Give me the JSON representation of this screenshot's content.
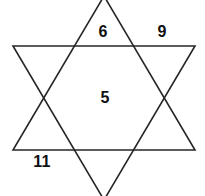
{
  "figure": {
    "name": "hexagram",
    "background_color": "#ffffff",
    "stroke_color": "#262626",
    "label_color": "#101010",
    "labels": [
      {
        "id": "top-point",
        "text": "6",
        "x": 103,
        "y": 32
      },
      {
        "id": "upper-right-outside",
        "text": "9",
        "x": 162,
        "y": 32
      },
      {
        "id": "center-hexagon",
        "text": "5",
        "x": 105,
        "y": 98
      },
      {
        "id": "lower-left-outside",
        "text": "11",
        "x": 42,
        "y": 162
      }
    ],
    "triangles": {
      "upward": {
        "name": "upward-triangle",
        "points": "104,-4 195,150 13,150"
      },
      "downward": {
        "name": "downward-triangle",
        "points": "104,200 13,46 195,46"
      }
    }
  }
}
